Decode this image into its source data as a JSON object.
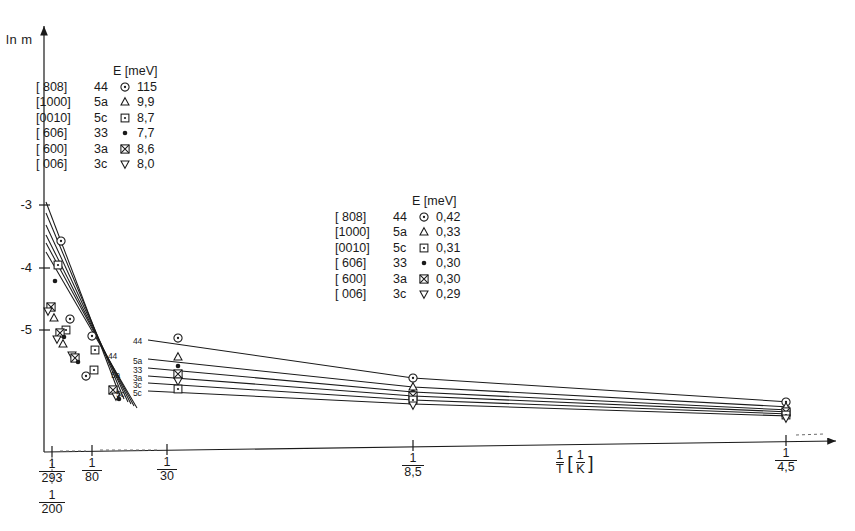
{
  "axes": {
    "y_label": "ln m",
    "y_ticks": [
      {
        "label": "-3",
        "y": 205
      },
      {
        "label": "-4",
        "y": 268
      },
      {
        "label": "-5",
        "y": 330
      }
    ],
    "x_label_num": "1",
    "x_label_den": "T",
    "x_unit_num": "1",
    "x_unit_den": "K",
    "x_ticks": [
      {
        "num": "1",
        "den": "293",
        "x": 52
      },
      {
        "num": "1",
        "den": "80",
        "x": 92
      },
      {
        "num": "1",
        "den": "30",
        "x": 167
      },
      {
        "num": "1",
        "den": "8,5",
        "x": 413
      },
      {
        "num": "1",
        "den": "4,5",
        "x": 786
      }
    ],
    "x_tick_extra": {
      "num": "1",
      "den": "200",
      "x": 52
    }
  },
  "legend_high": {
    "header": "E [meV]",
    "rows": [
      {
        "direction": "[ 808]",
        "index": "44",
        "marker": "circle-dot",
        "value": "115"
      },
      {
        "direction": "[1000]",
        "index": "5a",
        "marker": "triangle-up",
        "value": "9,9"
      },
      {
        "direction": "[0010]",
        "index": "5c",
        "marker": "square-dot",
        "value": "8,7"
      },
      {
        "direction": "[ 606]",
        "index": "33",
        "marker": "filled-dot",
        "value": "7,7"
      },
      {
        "direction": "[ 600]",
        "index": "3a",
        "marker": "crossed-square",
        "value": "8,6"
      },
      {
        "direction": "[ 006]",
        "index": "3c",
        "marker": "triangle-down",
        "value": "8,0"
      }
    ]
  },
  "legend_low": {
    "header": "E [meV]",
    "rows": [
      {
        "direction": "[ 808]",
        "index": "44",
        "marker": "circle-dot",
        "value": "0,42"
      },
      {
        "direction": "[1000]",
        "index": "5a",
        "marker": "triangle-up",
        "value": "0,33"
      },
      {
        "direction": "[0010]",
        "index": "5c",
        "marker": "square-dot",
        "value": "0,31"
      },
      {
        "direction": "[ 606]",
        "index": "33",
        "marker": "filled-dot",
        "value": "0,30"
      },
      {
        "direction": "[ 600]",
        "index": "3a",
        "marker": "crossed-square",
        "value": "0,30"
      },
      {
        "direction": "[ 006]",
        "index": "3c",
        "marker": "triangle-down",
        "value": "0,29"
      }
    ]
  },
  "curve_labels": [
    {
      "text": "44",
      "x": 133,
      "y": 337
    },
    {
      "text": "5a",
      "x": 133,
      "y": 357
    },
    {
      "text": "33",
      "x": 133,
      "y": 366
    },
    {
      "text": "3a",
      "x": 133,
      "y": 374
    },
    {
      "text": "3c",
      "x": 133,
      "y": 381
    },
    {
      "text": "5c",
      "x": 133,
      "y": 389
    },
    {
      "text": "44",
      "x": 108,
      "y": 352
    },
    {
      "text": "5a",
      "x": 111,
      "y": 371
    },
    {
      "text": "5c",
      "x": 116,
      "y": 390
    }
  ],
  "chart_data": {
    "type": "line",
    "title": "",
    "xlabel": "1/T [1/K]",
    "ylabel": "ln m",
    "xscale": "inverse-temperature",
    "ylim": [
      -6.2,
      -2.6
    ],
    "grid": false,
    "legend_position": "inside-upper-left and inside-center",
    "series": [
      {
        "name": "[ 808] 44",
        "marker": "circle-dot",
        "E_high_meV": 115,
        "E_low_meV": 0.42,
        "steep": [
          [
            0.00341,
            -3.05
          ],
          [
            0.0125,
            -5.55
          ]
        ],
        "shallow": [
          [
            0.0333,
            -5.1
          ],
          [
            0.1176,
            -5.52
          ],
          [
            0.2222,
            -5.8
          ]
        ]
      },
      {
        "name": "[1000] 5a",
        "marker": "triangle-up",
        "E_high_meV": 9.9,
        "E_low_meV": 0.33,
        "steep": [
          [
            0.00341,
            -3.18
          ],
          [
            0.0125,
            -5.68
          ]
        ],
        "shallow": [
          [
            0.0333,
            -5.35
          ],
          [
            0.1176,
            -5.68
          ],
          [
            0.2222,
            -5.92
          ]
        ]
      },
      {
        "name": "[0010] 5c",
        "marker": "square-dot",
        "E_high_meV": 8.7,
        "E_low_meV": 0.31,
        "steep": [
          [
            0.00341,
            -3.3
          ],
          [
            0.0125,
            -5.8
          ]
        ],
        "shallow": [
          [
            0.0333,
            -5.45
          ],
          [
            0.1176,
            -5.75
          ],
          [
            0.2222,
            -5.97
          ]
        ]
      },
      {
        "name": "[ 606] 33",
        "marker": "filled-dot",
        "E_high_meV": 7.7,
        "E_low_meV": 0.3,
        "steep": [
          [
            0.00341,
            -3.4
          ],
          [
            0.0125,
            -5.88
          ]
        ],
        "shallow": [
          [
            0.0333,
            -5.52
          ],
          [
            0.1176,
            -5.8
          ],
          [
            0.2222,
            -6.0
          ]
        ]
      },
      {
        "name": "[ 600] 3a",
        "marker": "crossed-square",
        "E_high_meV": 8.6,
        "E_low_meV": 0.3,
        "steep": [
          [
            0.00341,
            -3.48
          ],
          [
            0.0125,
            -5.95
          ]
        ],
        "shallow": [
          [
            0.0333,
            -5.58
          ],
          [
            0.1176,
            -5.85
          ],
          [
            0.2222,
            -6.03
          ]
        ]
      },
      {
        "name": "[ 006] 3c",
        "marker": "triangle-down",
        "E_high_meV": 8.0,
        "E_low_meV": 0.29,
        "steep": [
          [
            0.00341,
            -3.58
          ],
          [
            0.0125,
            -6.02
          ]
        ],
        "shallow": [
          [
            0.0333,
            -5.65
          ],
          [
            0.1176,
            -5.9
          ],
          [
            0.2222,
            -6.06
          ]
        ]
      }
    ]
  }
}
